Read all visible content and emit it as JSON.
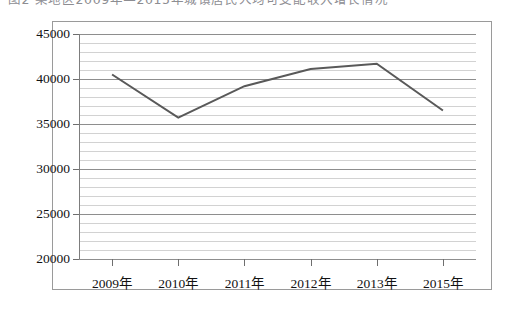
{
  "caption": {
    "text": "图2  某地区2009年—2015年城镇居民人均可支配收入增长情况"
  },
  "chart_data": {
    "type": "line",
    "title": "",
    "xlabel": "",
    "ylabel": "",
    "categories": [
      "2009年",
      "2010年",
      "2011年",
      "2012年",
      "2013年",
      "2015年"
    ],
    "values": [
      40500,
      35700,
      39200,
      41100,
      41700,
      36500
    ],
    "series": [
      {
        "name": "",
        "values": [
          40500,
          35700,
          39200,
          41100,
          41700,
          36500
        ]
      }
    ],
    "ylim": [
      20000,
      45000
    ],
    "ytick_labels": [
      "20000",
      "25000",
      "30000",
      "35000",
      "40000",
      "45000"
    ],
    "ytick_values": [
      20000,
      25000,
      30000,
      35000,
      40000,
      45000
    ],
    "ytick_minor_step": 1000,
    "grid": true,
    "grid_axis": "y",
    "legend": false,
    "legend_position": "none",
    "markers": false,
    "line_color": "#595959",
    "line_width": 2,
    "grid_color": "#d2d2d2",
    "major_grid_color": "#8e8e8e",
    "frame_color": "#9a9a9a",
    "background_color": "#ffffff",
    "text_color": "#121212"
  }
}
